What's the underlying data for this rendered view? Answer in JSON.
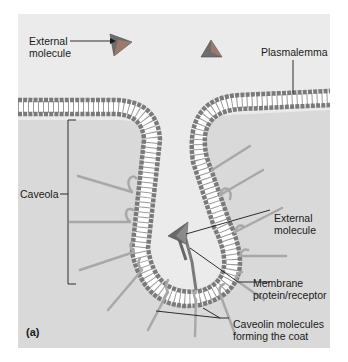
{
  "figure": {
    "panel_letter": "(a)",
    "labels": {
      "external_molecule_top_line1": "External",
      "external_molecule_top_line2": "molecule",
      "plasmalemma": "Plasmalemma",
      "caveola": "Caveola",
      "external_molecule_inner_line1": "External",
      "external_molecule_inner_line2": "molecule",
      "membrane_protein_line1": "Membrane",
      "membrane_protein_line2": "protein/receptor",
      "caveolin_line1": "Caveolin molecules",
      "caveolin_line2": "forming the coat"
    },
    "colors": {
      "outside_bg": "#ebebeb",
      "inside_bg": "#d9d9d9",
      "lipid_head": "#7d7d7d",
      "lipid_tail": "#ffffff",
      "caveolin": "#a8a8a8",
      "molecule": "#6a6a6a",
      "leader_line": "#1a1a1a"
    }
  }
}
